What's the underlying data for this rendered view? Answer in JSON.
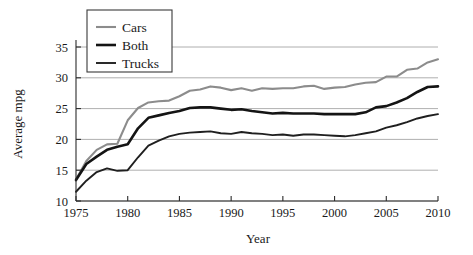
{
  "chart_data": {
    "type": "line",
    "title": "",
    "xlabel": "Year",
    "ylabel": "Average mpg",
    "xlim": [
      1975,
      2010
    ],
    "ylim": [
      10,
      36
    ],
    "grid": true,
    "grid_axis": "y",
    "legend_position": "top-left",
    "xticks": [
      1975,
      1980,
      1985,
      1990,
      1995,
      2000,
      2005,
      2010
    ],
    "xtick_labels": [
      "1975",
      "1980",
      "1985",
      "1990",
      "1995",
      "2000",
      "2005",
      "2010"
    ],
    "yticks": [
      10,
      15,
      20,
      25,
      30,
      35
    ],
    "ytick_labels": [
      "10",
      "15",
      "20",
      "25",
      "30",
      "35"
    ],
    "x": [
      1975,
      1976,
      1977,
      1978,
      1979,
      1980,
      1981,
      1982,
      1983,
      1984,
      1985,
      1986,
      1987,
      1988,
      1989,
      1990,
      1991,
      1992,
      1993,
      1994,
      1995,
      1996,
      1997,
      1998,
      1999,
      2000,
      2001,
      2002,
      2003,
      2004,
      2005,
      2006,
      2007,
      2008,
      2009,
      2010
    ],
    "series": [
      {
        "name": "Cars",
        "color": "#8c8c8c",
        "width": 2.1,
        "values": [
          13.5,
          16.5,
          18.3,
          19.2,
          19.3,
          23.1,
          25.1,
          26.0,
          26.2,
          26.3,
          27.0,
          27.9,
          28.1,
          28.6,
          28.4,
          28.0,
          28.3,
          27.9,
          28.3,
          28.2,
          28.3,
          28.3,
          28.6,
          28.7,
          28.2,
          28.4,
          28.5,
          28.9,
          29.2,
          29.3,
          30.2,
          30.2,
          31.3,
          31.5,
          32.5,
          33.0
        ]
      },
      {
        "name": "Both",
        "color": "#141414",
        "width": 2.6,
        "values": [
          13.4,
          16.0,
          17.2,
          18.3,
          18.8,
          19.2,
          21.8,
          23.5,
          23.9,
          24.3,
          24.6,
          25.1,
          25.2,
          25.2,
          25.0,
          24.8,
          24.9,
          24.6,
          24.4,
          24.2,
          24.3,
          24.2,
          24.2,
          24.2,
          24.1,
          24.1,
          24.1,
          24.1,
          24.4,
          25.2,
          25.4,
          26.0,
          26.7,
          27.7,
          28.5,
          28.6
        ]
      },
      {
        "name": "Trucks",
        "color": "#1f1f1f",
        "width": 1.9,
        "values": [
          11.5,
          13.3,
          14.7,
          15.3,
          14.9,
          15.0,
          17.1,
          19.0,
          19.8,
          20.5,
          20.9,
          21.1,
          21.2,
          21.3,
          21.0,
          20.9,
          21.2,
          21.0,
          20.9,
          20.7,
          20.8,
          20.6,
          20.8,
          20.8,
          20.7,
          20.6,
          20.5,
          20.7,
          21.0,
          21.3,
          21.9,
          22.3,
          22.8,
          23.4,
          23.8,
          24.1
        ]
      }
    ]
  },
  "legend": {
    "entries": [
      {
        "label": "Cars"
      },
      {
        "label": "Both"
      },
      {
        "label": "Trucks"
      }
    ]
  },
  "axes": {
    "x_title": "Year",
    "y_title": "Average mpg"
  }
}
